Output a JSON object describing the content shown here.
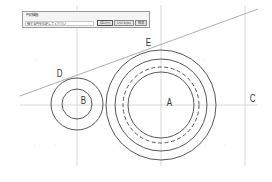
{
  "dialog": {
    "title": "円の描画",
    "prompt": "接する円を指定してください",
    "buttons": [
      {
        "label": "はい(Y)"
      },
      {
        "label": "いいえ(N)"
      },
      {
        "label": "取消"
      }
    ]
  },
  "labels": {
    "A": "A",
    "B": "B",
    "C": "C",
    "D": "D",
    "E": "E"
  },
  "drawing": {
    "line_color": "#444444",
    "guide_color": "#c8c8c8",
    "center_A": [
      161,
      105
    ],
    "center_B": [
      77,
      104
    ],
    "radii_A": {
      "outer": 55,
      "second": 46,
      "dashed": 38,
      "inner": 33
    },
    "radii_B": {
      "outer": 26,
      "inner": 15
    },
    "tangent_line": [
      [
        20,
        96
      ],
      [
        258,
        9
      ]
    ]
  }
}
